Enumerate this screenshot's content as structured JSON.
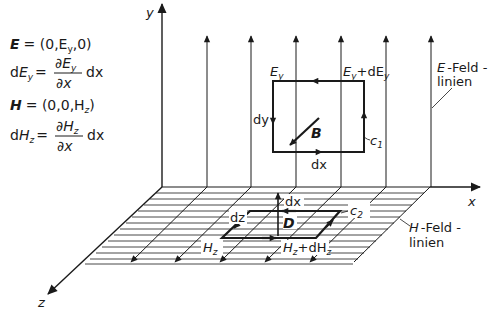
{
  "equations": {
    "E_def": {
      "lhs": "E",
      "rhs": "= (0,E",
      "sub": "y",
      "tail": ",0)"
    },
    "dEy": {
      "lhs_d": "d",
      "lhs": "E",
      "lhs_sub": "y",
      "eq": "=",
      "num": "∂E",
      "num_sub": "y",
      "den": "∂x",
      "tail": "dx"
    },
    "H_def": {
      "lhs": "H",
      "rhs": "= (0,0,H",
      "sub": "z",
      "tail": ")"
    },
    "dHz": {
      "lhs_d": "d",
      "lhs": "H",
      "lhs_sub": "z",
      "eq": "=",
      "num": "∂H",
      "num_sub": "z",
      "den": "∂x",
      "tail": "dx"
    }
  },
  "axes": {
    "x": "x",
    "y": "y",
    "z": "z"
  },
  "loop_c1": {
    "label": "c",
    "label_sub": "1",
    "top_left_label": "E",
    "top_left_sub": "y",
    "top_right_label": "E",
    "top_right_sub": "y",
    "top_right_plus": "+dE",
    "top_right_plus_sub": "y",
    "left_label": "dy",
    "bottom_label": "dx",
    "field_label": "B"
  },
  "loop_c2": {
    "label": "c",
    "label_sub": "2",
    "top_label": "dx",
    "left_label": "dz",
    "field_label": "D",
    "bottom_left_label": "H",
    "bottom_left_sub": "z",
    "bottom_right_label": "H",
    "bottom_right_sub": "z",
    "bottom_right_plus": "+dH",
    "bottom_right_plus_sub": "z"
  },
  "field_line_labels": {
    "E": {
      "symbol": "E",
      "line1": "-Feld -",
      "line2": "linien"
    },
    "H": {
      "symbol": "H",
      "line1": "-Feld -",
      "line2": "linien"
    }
  },
  "colors": {
    "ink": "#1a1a1a",
    "background": "#ffffff"
  }
}
